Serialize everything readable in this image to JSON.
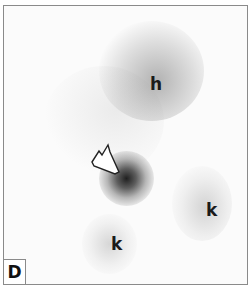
{
  "figure": {
    "panel_label": "D",
    "labels": [
      {
        "text": "h",
        "x": 147,
        "y": 74
      },
      {
        "text": "k",
        "x": 203,
        "y": 200
      },
      {
        "text": "k",
        "x": 109,
        "y": 233
      }
    ],
    "colors": {
      "border": "#8a8a8a",
      "background": "#fbfbfb",
      "uptake_dark": "#1e1e1e",
      "uptake_light": "#b0b0b0"
    }
  }
}
